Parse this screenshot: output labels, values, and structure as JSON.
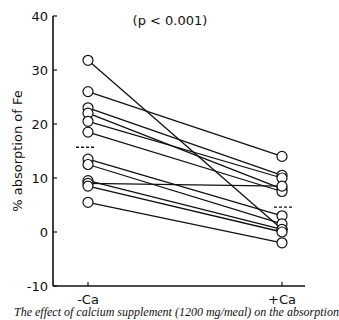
{
  "chart_data": {
    "type": "line",
    "title": "(p < 0.001)",
    "xlabel": "",
    "ylabel": "% absorption of Fe",
    "categories": [
      "-Ca",
      "+Ca"
    ],
    "ylim": [
      -10,
      40
    ],
    "yticks": [
      -10,
      0,
      10,
      20,
      30,
      40
    ],
    "grid": false,
    "legend": "none",
    "marker": "open-circle",
    "series": [
      {
        "name": "subject-1",
        "values": [
          31.8,
          0.5
        ]
      },
      {
        "name": "subject-2",
        "values": [
          26.0,
          14.0
        ]
      },
      {
        "name": "subject-3",
        "values": [
          23.0,
          10.5
        ]
      },
      {
        "name": "subject-4",
        "values": [
          22.0,
          8.0
        ]
      },
      {
        "name": "subject-5",
        "values": [
          20.5,
          10.0
        ]
      },
      {
        "name": "subject-6",
        "values": [
          18.5,
          7.5
        ]
      },
      {
        "name": "subject-7",
        "values": [
          13.5,
          3.0
        ]
      },
      {
        "name": "subject-8",
        "values": [
          12.5,
          1.5
        ]
      },
      {
        "name": "subject-9",
        "values": [
          9.5,
          0.5
        ]
      },
      {
        "name": "subject-10",
        "values": [
          9.0,
          8.5
        ]
      },
      {
        "name": "subject-11",
        "values": [
          8.5,
          0.0
        ]
      },
      {
        "name": "subject-12",
        "values": [
          5.5,
          -2.0
        ]
      }
    ],
    "means": {
      "-Ca": 15.7,
      "+Ca": 4.6
    },
    "annotations": [
      "(p < 0.001)",
      "dashed lines indicate group means"
    ]
  },
  "caption": "The effect of calcium supplement (1200 mg/meal) on the absorption"
}
